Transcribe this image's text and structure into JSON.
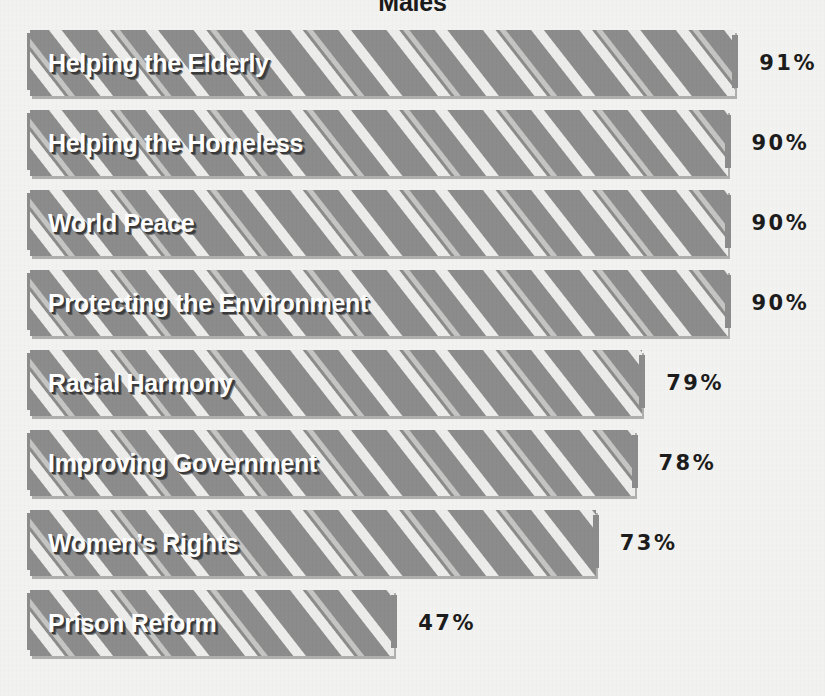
{
  "chart_data": {
    "type": "bar",
    "orientation": "horizontal",
    "title": "Males",
    "xlabel": "",
    "ylabel": "",
    "xlim": [
      0,
      100
    ],
    "grid": false,
    "legend": null,
    "value_suffix": "%",
    "categories": [
      "Helping the Elderly",
      "Helping the Homeless",
      "World Peace",
      "Protecting the Environment",
      "Racial Harmony",
      "Improving Government",
      "Women’s Rights",
      "Prison Reform"
    ],
    "values": [
      91,
      90,
      90,
      90,
      79,
      78,
      73,
      47
    ],
    "value_labels": [
      "91%",
      "90%",
      "90%",
      "90%",
      "79%",
      "78%",
      "73%",
      "47%"
    ],
    "bars": [
      {
        "label": "Helping the Elderly",
        "value": 91,
        "value_label": "91%"
      },
      {
        "label": "Helping the Homeless",
        "value": 90,
        "value_label": "90%"
      },
      {
        "label": "World Peace",
        "value": 90,
        "value_label": "90%"
      },
      {
        "label": "Protecting the Environment",
        "value": 90,
        "value_label": "90%"
      },
      {
        "label": "Racial Harmony",
        "value": 79,
        "value_label": "79%"
      },
      {
        "label": "Improving Government",
        "value": 78,
        "value_label": "78%"
      },
      {
        "label": "Women’s Rights",
        "value": 73,
        "value_label": "73%"
      },
      {
        "label": "Prison Reform",
        "value": 47,
        "value_label": "47%"
      }
    ],
    "colors": {
      "background": "#f2f2f0",
      "bar_fill": "#8c8c8c",
      "bar_hatch": "#f4f4f2",
      "label_text": "#ffffff",
      "label_shadow": "#3a3a3a",
      "value_text": "#1c1c1c",
      "title_text": "#1b1b1b"
    }
  },
  "layout": {
    "bar_left_px": 30,
    "bar_height_px": 66,
    "row_pitch_px": 80,
    "first_row_top_px": 30,
    "value_gap_px": 24,
    "scale_px_per_unit": 7.75
  }
}
